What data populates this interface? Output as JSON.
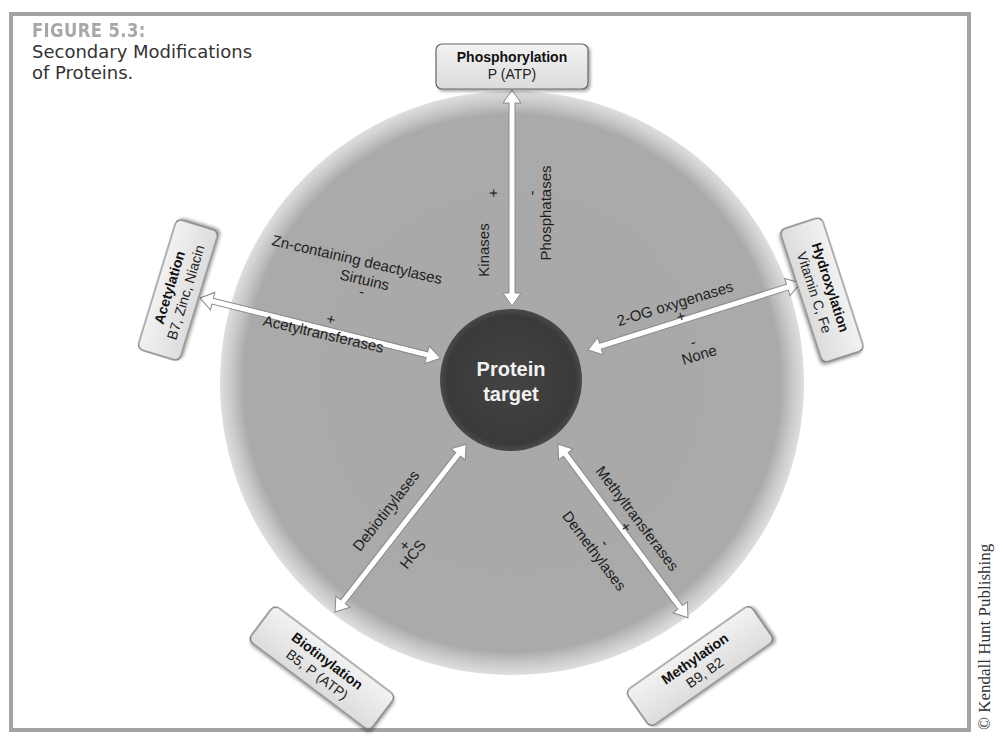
{
  "figure": {
    "label": "FIGURE 5.3:",
    "title_line1": "Secondary Modifications",
    "title_line2": "of Proteins."
  },
  "center": {
    "line1": "Protein",
    "line2": "target"
  },
  "modifications": {
    "phosphorylation": {
      "title": "Phosphorylation",
      "cofactors": "P (ATP)",
      "plus_symbol": "+",
      "plus_enzyme": "Kinases",
      "minus_symbol": "-",
      "minus_enzyme": "Phosphatases"
    },
    "acetylation": {
      "title": "Acetylation",
      "cofactors": "B7, Zinc, Niacin",
      "minus_enzyme_line1": "Zn-containing deactylases",
      "minus_enzyme_line2": "Sirtuins",
      "minus_symbol": "-",
      "plus_symbol": "+",
      "plus_enzyme": "Acetyltransferases"
    },
    "hydroxylation": {
      "title": "Hydroxylation",
      "cofactors": "Vitamin C, Fe",
      "plus_enzyme": "2-OG oxygenases",
      "plus_symbol": "+",
      "minus_symbol": "-",
      "minus_enzyme": "None"
    },
    "biotinylation": {
      "title": "Biotinylation",
      "cofactors": "B5, P (ATP)",
      "minus_enzyme": "Debiotinylases",
      "minus_symbol": "-",
      "plus_symbol": "+",
      "plus_enzyme": "HCS"
    },
    "methylation": {
      "title": "Methylation",
      "cofactors": "B9, B2",
      "plus_enzyme": "Methyltransferases",
      "plus_symbol": "+",
      "minus_symbol": "-",
      "minus_enzyme": "Demethylases"
    }
  },
  "copyright": "© Kendall Hunt Publishing",
  "colors": {
    "outer_circle": "#a9a9a9",
    "center_circle": "#3d3d3d",
    "box_fill": "#e6e6e6",
    "frame": "#a3a3a3",
    "figure_label": "#a7a7a7"
  }
}
